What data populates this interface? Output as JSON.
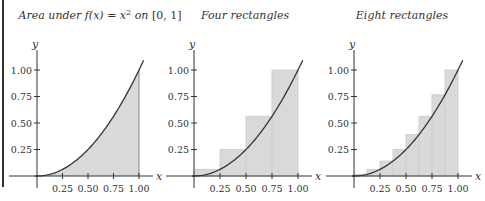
{
  "colors": {
    "curve": "#333333",
    "fill": "#d9d9d9",
    "rect_stroke": "#cfcfcf",
    "axis": "#333333"
  },
  "chart_data": [
    {
      "type": "area",
      "title": "Area under f(x) = x² on [0, 1]",
      "title_parts": {
        "pre": "Area under ",
        "fx": "f(x) = x",
        "sup": "2",
        "post": " on ",
        "interval": "[0, 1]"
      },
      "xlabel": "x",
      "ylabel": "y",
      "xticks": [
        "0.25",
        "0.50",
        "0.75",
        "1.00"
      ],
      "yticks": [
        "0.25",
        "0.50",
        "0.75",
        "1.00"
      ],
      "function": "x^2",
      "shaded_interval": [
        0,
        1
      ],
      "xlim": [
        -0.1,
        1.1
      ],
      "ylim": [
        0,
        1.15
      ]
    },
    {
      "type": "bar",
      "title": "Four rectangles",
      "xlabel": "x",
      "ylabel": "y",
      "xticks": [
        "0.25",
        "0.50",
        "0.75",
        "1.00"
      ],
      "yticks": [
        "0.25",
        "0.50",
        "0.75",
        "1.00"
      ],
      "function": "x^2",
      "rectangles": [
        {
          "x0": 0.0,
          "x1": 0.25,
          "height": 0.0625
        },
        {
          "x0": 0.25,
          "x1": 0.5,
          "height": 0.25
        },
        {
          "x0": 0.5,
          "x1": 0.75,
          "height": 0.5625
        },
        {
          "x0": 0.75,
          "x1": 1.0,
          "height": 1.0
        }
      ]
    },
    {
      "type": "bar",
      "title": "Eight rectangles",
      "xlabel": "x",
      "ylabel": "y",
      "xticks": [
        "0.25",
        "0.50",
        "0.75",
        "1.00"
      ],
      "yticks": [
        "0.25",
        "0.50",
        "0.75",
        "1.00"
      ],
      "function": "x^2",
      "rectangles": [
        {
          "x0": 0.0,
          "x1": 0.125,
          "height": 0.015625
        },
        {
          "x0": 0.125,
          "x1": 0.25,
          "height": 0.0625
        },
        {
          "x0": 0.25,
          "x1": 0.375,
          "height": 0.140625
        },
        {
          "x0": 0.375,
          "x1": 0.5,
          "height": 0.25
        },
        {
          "x0": 0.5,
          "x1": 0.625,
          "height": 0.390625
        },
        {
          "x0": 0.625,
          "x1": 0.75,
          "height": 0.5625
        },
        {
          "x0": 0.75,
          "x1": 0.875,
          "height": 0.765625
        },
        {
          "x0": 0.875,
          "x1": 1.0,
          "height": 1.0
        }
      ]
    }
  ]
}
